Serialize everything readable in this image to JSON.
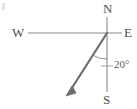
{
  "figure": {
    "kind": "compass-bearing-diagram",
    "width": 137,
    "height": 109,
    "background_color": "#ffffff"
  },
  "colors": {
    "axis_stroke": "#8a8a8a",
    "vector_stroke": "#6d6d6d",
    "leader_stroke": "#9a9a9a",
    "arc_stroke": "#8a8a8a",
    "label_text": "#4f4f4f",
    "angle_text": "#5a5a5a",
    "artifact": "#d8d8d8"
  },
  "compass": {
    "north_label": "N",
    "east_label": "E",
    "west_label": "W",
    "south_label": "S",
    "origin": {
      "x": 107,
      "y": 33
    },
    "horizontal_axis": {
      "x1": 28,
      "y1": 33,
      "x2": 122,
      "y2": 33
    },
    "vertical_axis": {
      "x1": 107,
      "y1": 17,
      "x2": 107,
      "y2": 92
    }
  },
  "bearing_vector": {
    "label": "bearing-arrow",
    "start": {
      "x": 107,
      "y": 33
    },
    "end": {
      "x": 67,
      "y": 95
    },
    "arrowhead_size": 9
  },
  "angle_annotation": {
    "value_text": "20°",
    "degrees": 20,
    "measured_from": "S",
    "arc": {
      "center_x": 107,
      "center_y": 33,
      "radius": 26
    },
    "leader_line": {
      "x1": 101,
      "y1": 66,
      "x2": 113,
      "y2": 66
    }
  }
}
